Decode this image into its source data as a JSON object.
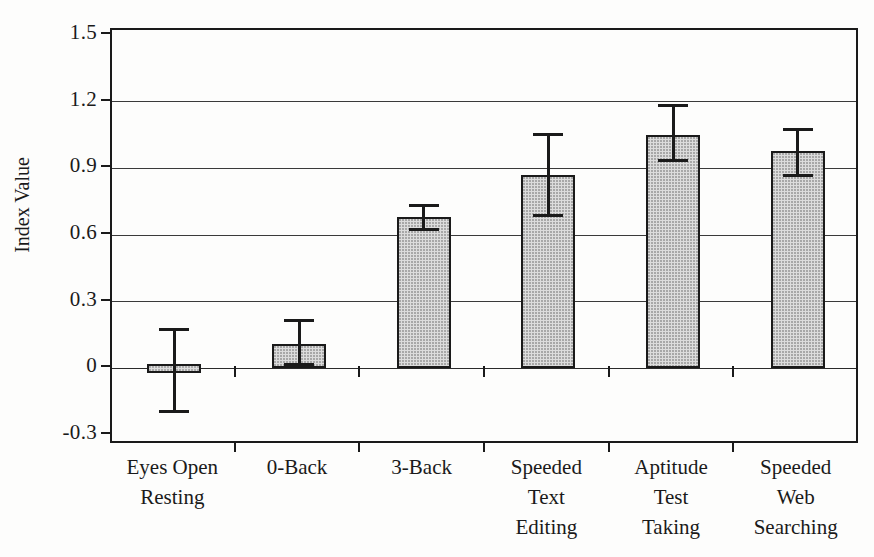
{
  "chart_data": {
    "type": "bar",
    "title": "",
    "xlabel": "",
    "ylabel": "Index Value",
    "ylim": [
      -0.3,
      1.5
    ],
    "ytick_labels": [
      "1.5",
      "1.2",
      "0.9",
      "0.6",
      "0.3",
      "0",
      "-0.3"
    ],
    "ytick_values": [
      1.5,
      1.2,
      0.9,
      0.6,
      0.3,
      0,
      -0.3
    ],
    "grid": true,
    "grid_axis": "y",
    "legend": null,
    "bar_fill_color": "#dcdcdc",
    "bar_edge_color": "#1a1a1a",
    "error_bar_color": "#1a1a1a",
    "categories": [
      "Eyes Open\nResting",
      "0-Back",
      "3-Back",
      "Speeded\nText\nEditing",
      "Aptitude\nTest\nTaking",
      "Speeded\nWeb\nSearching"
    ],
    "values": [
      -0.01,
      0.11,
      0.68,
      0.87,
      1.05,
      0.98
    ],
    "error_upper": [
      0.18,
      0.22,
      0.74,
      1.06,
      1.19,
      1.08
    ],
    "error_lower": [
      -0.2,
      0.01,
      0.62,
      0.68,
      0.93,
      0.86
    ],
    "series": [
      {
        "name": "Index Value",
        "values": [
          -0.01,
          0.11,
          0.68,
          0.87,
          1.05,
          0.98
        ]
      }
    ]
  },
  "axis": {
    "ylabel_text": "Index Value"
  }
}
